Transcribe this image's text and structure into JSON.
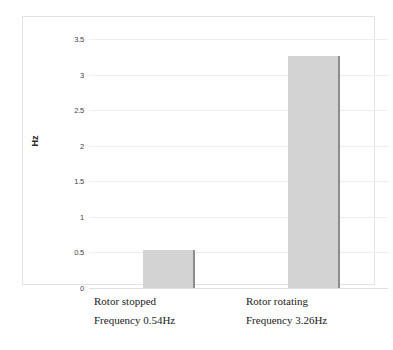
{
  "chart_data": {
    "type": "bar",
    "title": "",
    "subtitle": "",
    "xlabel": "",
    "ylabel": "Hz",
    "ylim": [
      0,
      3.5
    ],
    "grid": true,
    "legend": false,
    "legend_position": "none",
    "categories": [
      "Rotor stopped",
      "Rotor rotating"
    ],
    "values": [
      0.54,
      3.26
    ],
    "yticks": [
      "0",
      "0.5",
      "1",
      "1.5",
      "2",
      "2.5",
      "3",
      "3.5"
    ],
    "ytick_values": [
      0,
      0.5,
      1,
      1.5,
      2,
      2.5,
      3,
      3.5
    ],
    "xtick_labels": [
      "",
      ""
    ],
    "annotations": [
      {
        "line1": "Rotor stopped",
        "line2": "Frequency 0.54Hz"
      },
      {
        "line1": "Rotor rotating",
        "line2": "Frequency 3.26Hz"
      }
    ],
    "series": [
      {
        "name": "Hz",
        "values": [
          0.54,
          3.26
        ],
        "color": "#d3d3d3",
        "edge_color": "#8d8d8d"
      }
    ]
  },
  "axis": {
    "y_title": "Hz",
    "ticks": [
      {
        "label": "3.5",
        "value": 3.5
      },
      {
        "label": "3",
        "value": 3
      },
      {
        "label": "2.5",
        "value": 2.5
      },
      {
        "label": "2",
        "value": 2
      },
      {
        "label": "1.5",
        "value": 1.5
      },
      {
        "label": "1",
        "value": 1
      },
      {
        "label": "0.5",
        "value": 0.5
      },
      {
        "label": "0",
        "value": 0
      }
    ]
  },
  "captions": [
    {
      "line1": "Rotor stopped",
      "line2": "Frequency 0.54Hz"
    },
    {
      "line1": "Rotor rotating",
      "line2": "Frequency 3.26Hz"
    }
  ],
  "colors": {
    "bar_fill": "#d3d3d3",
    "bar_edge": "#8d8d8d",
    "gridline": "#eeeeee",
    "frame": "#e3e3e3",
    "background": "#ffffff",
    "tick_text": "#3f3f3f",
    "caption_text": "#1a1a1a"
  }
}
